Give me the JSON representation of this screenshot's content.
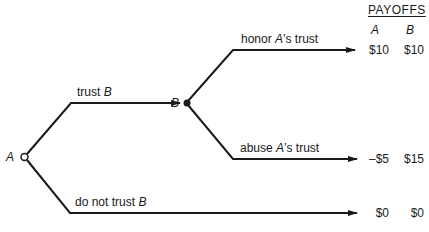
{
  "payoffs_header": "PAYOFFS",
  "columns": [
    "A",
    "B"
  ],
  "nodes": {
    "A": {
      "label": "A",
      "style": "open-circle"
    },
    "B": {
      "label": "B",
      "style": "filled-circle"
    }
  },
  "branches": {
    "trust": {
      "text": "trust ",
      "player": "B"
    },
    "not_trust": {
      "text": "do not trust ",
      "player": "B"
    },
    "honor": {
      "text_pre": "honor ",
      "player": "A",
      "text_post": "’s trust"
    },
    "abuse": {
      "text_pre": "abuse ",
      "player": "A",
      "text_post": "’s trust"
    }
  },
  "outcomes": [
    {
      "name": "honor",
      "A": "$10",
      "B": "$10"
    },
    {
      "name": "abuse",
      "A": "–$5",
      "B": "$15"
    },
    {
      "name": "not_trust",
      "A": "$0",
      "B": "$0"
    }
  ],
  "colors": {
    "line": "#1a1a1a",
    "background": "#ffffff"
  }
}
